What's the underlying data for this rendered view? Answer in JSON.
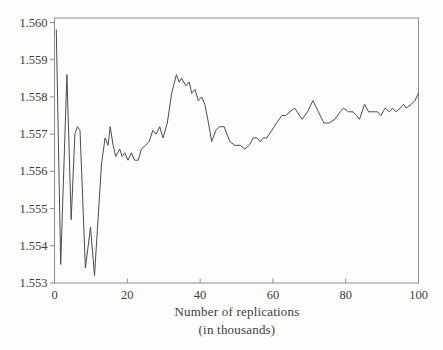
{
  "figure": {
    "background": "#fdfdfc",
    "frame_color": "#8e8d8b",
    "tick_color": "#8e8d8b",
    "line_color": "#4c4b49",
    "text_color": "#3d3c3a"
  },
  "chart_data": {
    "type": "line",
    "title": "",
    "xlabel": "Number of replications",
    "xlabel_line2": "(in thousands)",
    "ylabel": "",
    "xlim": [
      0,
      100
    ],
    "ylim": [
      1.553,
      1.56
    ],
    "grid": false,
    "legend": null,
    "x_ticks": [
      0,
      20,
      40,
      60,
      80,
      100
    ],
    "y_ticks": [
      "1.553",
      "1.554",
      "1.555",
      "1.556",
      "1.557",
      "1.558",
      "1.559",
      "1.560"
    ],
    "series": [
      {
        "name": "running-mean-estimate",
        "points": [
          [
            0.5,
            1.5598
          ],
          [
            1.7,
            1.5535
          ],
          [
            3.4,
            1.5586
          ],
          [
            4.6,
            1.5547
          ],
          [
            5.6,
            1.557
          ],
          [
            6.3,
            1.5572
          ],
          [
            7.0,
            1.5571
          ],
          [
            8.5,
            1.5534
          ],
          [
            9.9,
            1.5545
          ],
          [
            11.0,
            1.5532
          ],
          [
            12.9,
            1.5562
          ],
          [
            13.9,
            1.5569
          ],
          [
            14.7,
            1.5567
          ],
          [
            15.3,
            1.5572
          ],
          [
            16.1,
            1.5567
          ],
          [
            16.8,
            1.5564
          ],
          [
            17.9,
            1.5566
          ],
          [
            18.6,
            1.5564
          ],
          [
            19.3,
            1.5565
          ],
          [
            20.2,
            1.5563
          ],
          [
            21.1,
            1.5565
          ],
          [
            22.0,
            1.5563
          ],
          [
            23.0,
            1.5563
          ],
          [
            23.9,
            1.5566
          ],
          [
            25.0,
            1.5567
          ],
          [
            26.0,
            1.5568
          ],
          [
            27.0,
            1.5571
          ],
          [
            27.9,
            1.557
          ],
          [
            28.9,
            1.5572
          ],
          [
            29.8,
            1.5569
          ],
          [
            31.0,
            1.5573
          ],
          [
            32.2,
            1.5581
          ],
          [
            33.5,
            1.5586
          ],
          [
            34.2,
            1.5584
          ],
          [
            34.9,
            1.5585
          ],
          [
            36.1,
            1.5583
          ],
          [
            37.0,
            1.5584
          ],
          [
            37.7,
            1.5581
          ],
          [
            38.6,
            1.5582
          ],
          [
            39.5,
            1.5579
          ],
          [
            40.4,
            1.558
          ],
          [
            41.3,
            1.5578
          ],
          [
            42.3,
            1.5573
          ],
          [
            43.2,
            1.5568
          ],
          [
            44.3,
            1.5571
          ],
          [
            45.3,
            1.5572
          ],
          [
            46.6,
            1.5572
          ],
          [
            48.2,
            1.5568
          ],
          [
            49.5,
            1.5567
          ],
          [
            51.0,
            1.5567
          ],
          [
            52.3,
            1.5566
          ],
          [
            53.5,
            1.5567
          ],
          [
            54.6,
            1.5569
          ],
          [
            55.6,
            1.5569
          ],
          [
            56.5,
            1.5568
          ],
          [
            57.4,
            1.5569
          ],
          [
            58.3,
            1.5569
          ],
          [
            59.7,
            1.5571
          ],
          [
            61.0,
            1.5573
          ],
          [
            62.5,
            1.5575
          ],
          [
            63.5,
            1.5575
          ],
          [
            64.7,
            1.5576
          ],
          [
            66.0,
            1.5577
          ],
          [
            68.0,
            1.5574
          ],
          [
            69.5,
            1.5576
          ],
          [
            71.0,
            1.5579
          ],
          [
            72.5,
            1.5576
          ],
          [
            74.0,
            1.5573
          ],
          [
            75.5,
            1.5573
          ],
          [
            77.0,
            1.5574
          ],
          [
            78.5,
            1.5576
          ],
          [
            79.4,
            1.5577
          ],
          [
            80.8,
            1.5576
          ],
          [
            82.0,
            1.5576
          ],
          [
            83.0,
            1.5575
          ],
          [
            83.8,
            1.5574
          ],
          [
            85.2,
            1.5578
          ],
          [
            86.3,
            1.5576
          ],
          [
            87.5,
            1.5576
          ],
          [
            88.7,
            1.5576
          ],
          [
            89.7,
            1.5575
          ],
          [
            90.8,
            1.5577
          ],
          [
            92.0,
            1.5576
          ],
          [
            92.9,
            1.5577
          ],
          [
            93.8,
            1.5576
          ],
          [
            95.0,
            1.5577
          ],
          [
            95.9,
            1.5578
          ],
          [
            96.6,
            1.5577
          ],
          [
            98.0,
            1.5578
          ],
          [
            99.0,
            1.5579
          ],
          [
            100.0,
            1.5581
          ]
        ]
      }
    ]
  }
}
